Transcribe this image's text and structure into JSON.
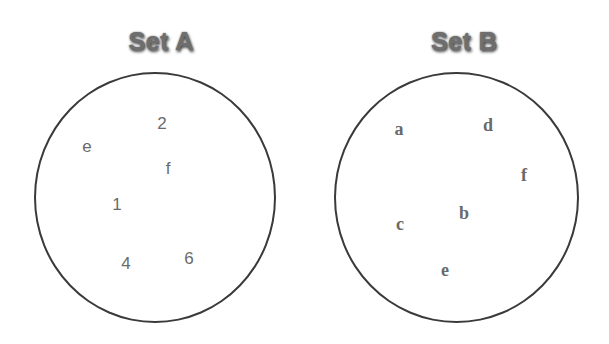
{
  "diagram": {
    "type": "set-diagram",
    "sets": [
      {
        "title": "Set A",
        "elements": [
          {
            "label": "e",
            "x": 87,
            "y": 146
          },
          {
            "label": "2",
            "x": 162,
            "y": 123
          },
          {
            "label": "f",
            "x": 168,
            "y": 168
          },
          {
            "label": "1",
            "x": 117,
            "y": 204
          },
          {
            "label": "4",
            "x": 126,
            "y": 263
          },
          {
            "label": "6",
            "x": 189,
            "y": 258
          }
        ]
      },
      {
        "title": "Set B",
        "elements": [
          {
            "label": "a",
            "x": 399,
            "y": 129
          },
          {
            "label": "d",
            "x": 488,
            "y": 125
          },
          {
            "label": "f",
            "x": 524,
            "y": 175
          },
          {
            "label": "b",
            "x": 464,
            "y": 213
          },
          {
            "label": "c",
            "x": 400,
            "y": 224
          },
          {
            "label": "e",
            "x": 445,
            "y": 270
          }
        ]
      }
    ]
  }
}
